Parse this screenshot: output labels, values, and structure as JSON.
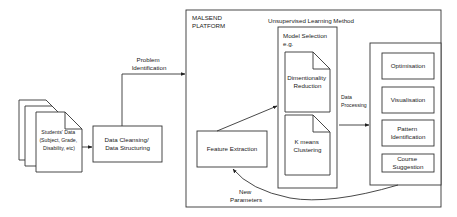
{
  "students_data": {
    "lines": [
      "Students' Data",
      "(Subject, Grade,",
      "Disability, etc)"
    ]
  },
  "data_cleansing": {
    "lines": [
      "Data Cleansing/",
      "Data Structuring"
    ]
  },
  "problem_identification": {
    "lines": [
      "Problem",
      "Identification"
    ]
  },
  "platform": {
    "lines": [
      "MALSEND",
      "PLATFORM"
    ]
  },
  "unsupervised_title": "Unsupervised Learning Method",
  "model_selection": {
    "lines": [
      "Model Selection",
      "e.g."
    ]
  },
  "dimensionality": {
    "lines": [
      "Dimentionality",
      "Reduction"
    ]
  },
  "kmeans": {
    "lines": [
      "K means",
      "Clustering"
    ]
  },
  "feature_extraction": "Feature Extraction",
  "data_processing": {
    "lines": [
      "Data",
      "Processing"
    ]
  },
  "new_parameters": {
    "lines": [
      "New",
      "Parameters"
    ]
  },
  "outputs": [
    {
      "lines": [
        "Optimisation"
      ]
    },
    {
      "lines": [
        "Visualisation"
      ]
    },
    {
      "lines": [
        "Pattern",
        "Identification"
      ]
    },
    {
      "lines": [
        "Course",
        "Suggestion"
      ]
    }
  ]
}
